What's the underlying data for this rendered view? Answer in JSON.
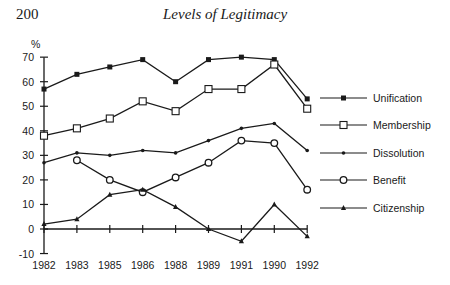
{
  "page": {
    "number": "200",
    "running_head": "Levels of Legitimacy"
  },
  "chart_data": {
    "type": "line",
    "title": "",
    "xlabel": "",
    "ylabel": "%",
    "ylim": [
      -10,
      70
    ],
    "yticks": [
      -10,
      0,
      10,
      20,
      30,
      40,
      50,
      60,
      70
    ],
    "categories": [
      "1982",
      "1983",
      "1985",
      "1986",
      "1988",
      "1989",
      "1991",
      "1990",
      "1992"
    ],
    "grid": false,
    "legend_position": "right",
    "series": [
      {
        "name": "Unification",
        "marker": "filled-square",
        "values": [
          57,
          63,
          66,
          69,
          60,
          69,
          70,
          69,
          53
        ]
      },
      {
        "name": "Membership",
        "marker": "open-square",
        "values": [
          38,
          41,
          45,
          52,
          48,
          57,
          57,
          67,
          49
        ]
      },
      {
        "name": "Dissolution",
        "marker": "dot",
        "values": [
          27,
          31,
          30,
          32,
          31,
          36,
          41,
          43,
          32
        ]
      },
      {
        "name": "Benefit",
        "marker": "open-diamond",
        "values": [
          null,
          28,
          20,
          15,
          21,
          27,
          36,
          35,
          16
        ]
      },
      {
        "name": "Citizenship",
        "marker": "filled-triangle",
        "values": [
          2,
          4,
          14,
          16,
          9,
          0,
          -5,
          10,
          -3
        ]
      }
    ]
  }
}
